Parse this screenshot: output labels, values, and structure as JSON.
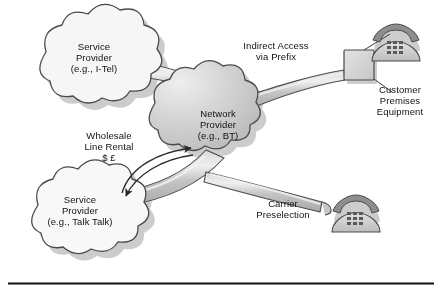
{
  "diagram": {
    "background": "#ffffff",
    "rule_color": "#111111",
    "colors": {
      "cloud_light_fill": "#f4f4f4",
      "cloud_center_fill": "#c9c9c9",
      "outline": "#4a4a4a",
      "pipe_fill": "#bdbdbd",
      "pipe_highlight": "#e2e2e2",
      "shadow": "#bfbfbf",
      "box_fill": "#d6d6d6",
      "phone_body": "#cfcfcf",
      "phone_handset": "#8e8e8e",
      "text": "#111111"
    },
    "nodes": [
      {
        "id": "sp-itel",
        "type": "cloud",
        "lines": [
          "Service",
          "Provider",
          "(e.g., I-Tel)"
        ]
      },
      {
        "id": "network-provider",
        "type": "cloud",
        "lines": [
          "Network",
          "Provider",
          "(e.g., BT)"
        ]
      },
      {
        "id": "sp-talktalk",
        "type": "cloud",
        "lines": [
          "Service",
          "Provider",
          "(e.g., Talk Talk)"
        ]
      },
      {
        "id": "cpe-box",
        "type": "box",
        "lines": [
          "Customer",
          "Premises",
          "Equipment"
        ]
      },
      {
        "id": "phone-top",
        "type": "telephone",
        "lines": []
      },
      {
        "id": "phone-bottom",
        "type": "telephone",
        "lines": []
      }
    ],
    "labels": [
      {
        "id": "indirect-access",
        "lines": [
          "Indirect Access",
          "via Prefix"
        ]
      },
      {
        "id": "customer-premises-equipment",
        "lines": [
          "Customer",
          "Premises",
          "Equipment"
        ]
      },
      {
        "id": "wholesale-line-rental",
        "lines": [
          "Wholesale",
          "Line Rental",
          "$ £"
        ]
      },
      {
        "id": "carrier-preselection",
        "lines": [
          "Carrier",
          "Preselection"
        ]
      }
    ],
    "connections": [
      {
        "id": "itel-to-network",
        "style": "pipe",
        "from": "sp-itel",
        "to": "network-provider"
      },
      {
        "id": "network-to-cpe",
        "style": "pipe",
        "from": "network-provider",
        "to": "cpe-box"
      },
      {
        "id": "talktalk-to-network",
        "style": "pipe",
        "from": "sp-talktalk",
        "to": "network-provider"
      },
      {
        "id": "network-to-phone-bottom",
        "style": "pipe",
        "from": "network-provider",
        "to": "phone-bottom"
      },
      {
        "id": "wlr-exchange",
        "style": "double-arrow",
        "from": "sp-talktalk",
        "to": "network-provider"
      },
      {
        "id": "cpe-to-phone-top",
        "style": "thin-line",
        "from": "cpe-box",
        "to": "phone-top"
      },
      {
        "id": "cpe-to-label",
        "style": "thin-line",
        "from": "cpe-box",
        "to": "customer-premises-equipment"
      },
      {
        "id": "phone-bottom-to-pipe",
        "style": "thin-line",
        "from": "phone-bottom",
        "to": "network-to-phone-bottom"
      }
    ]
  }
}
